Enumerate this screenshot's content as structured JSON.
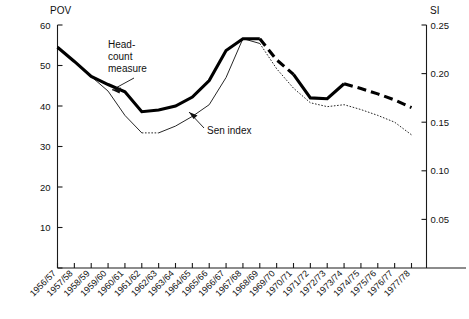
{
  "chart_data": {
    "type": "line",
    "title": "",
    "xlabel": "",
    "ylabel": "POV",
    "ylabel_right": "SI",
    "grid": false,
    "legend": "none",
    "ylim": [
      0,
      60
    ],
    "ylim_right": [
      0,
      0.25
    ],
    "yticks": [
      0,
      10,
      20,
      30,
      40,
      50,
      60
    ],
    "ytick_labels": [
      "",
      "10",
      "20",
      "30",
      "40",
      "50",
      "60"
    ],
    "yticks_right": [
      0.05,
      0.1,
      0.15,
      0.2,
      0.25
    ],
    "ytick_labels_right": [
      "0.05",
      "0.10",
      "0.15",
      "0.20",
      "0.25"
    ],
    "categories": [
      "1956/57",
      "1957/58",
      "1958/59",
      "1959/60",
      "1960/61",
      "1961/62",
      "1962/63",
      "1963/64",
      "1964/65",
      "1965/66",
      "1966/67",
      "1967/68",
      "1968/69",
      "1969/70",
      "1970/71",
      "1971/72",
      "1972/73",
      "1973/74",
      "1974/75",
      "1975/76",
      "1976/77",
      "1977/78"
    ],
    "series": [
      {
        "name": "Head-count measure",
        "axis": "left",
        "style": "thick solid then dashed",
        "dash_begins_at": "1968/69",
        "values": [
          54.5,
          51.0,
          47.3,
          45.3,
          43.5,
          38.6,
          39.0,
          40.0,
          42.2,
          46.3,
          53.7,
          56.6,
          56.6,
          51.4,
          47.8,
          42.0,
          41.8,
          45.5,
          44.3,
          43.0,
          41.5,
          39.6
        ]
      },
      {
        "name": "Sen index",
        "axis": "right",
        "style": "thin solid then dotted",
        "dot_begins_at": "1961/62",
        "values": [
          0.228,
          0.213,
          0.197,
          0.182,
          0.157,
          0.139,
          0.139,
          0.146,
          0.156,
          0.168,
          0.196,
          0.236,
          0.231,
          0.205,
          0.185,
          0.17,
          0.166,
          0.168,
          0.163,
          0.157,
          0.15,
          0.137
        ]
      }
    ],
    "annotations": [
      {
        "text": "Head-\ncount\nmeasure",
        "target_series": "Head-count measure",
        "target_category": "1960/61"
      },
      {
        "text": "Sen index",
        "target_series": "Sen index",
        "target_category": "1965/66"
      }
    ]
  },
  "axes": {
    "left_title": "POV",
    "right_title": "SI"
  },
  "annotations": {
    "headcount_line1": "Head-",
    "headcount_line2": "count",
    "headcount_line3": "measure",
    "sen": "Sen index"
  }
}
